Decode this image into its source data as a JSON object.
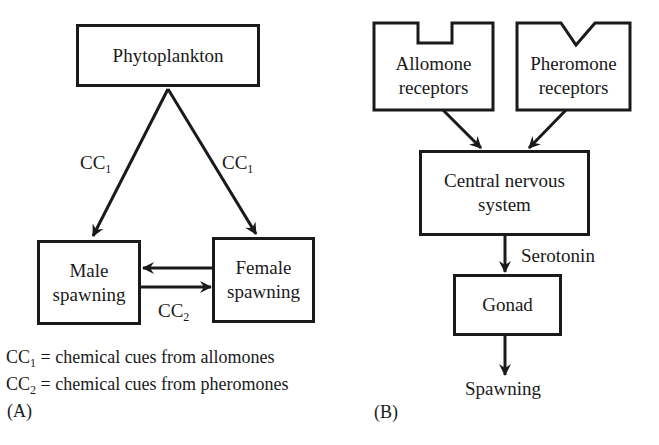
{
  "panel_a": {
    "label": "(A)",
    "nodes": {
      "phytoplankton": "Phytoplankton",
      "male_line1": "Male",
      "male_line2": "spawning",
      "female_line1": "Female",
      "female_line2": "spawning"
    },
    "edges": {
      "left_cue": "CC",
      "left_cue_sub": "1",
      "right_cue": "CC",
      "right_cue_sub": "1",
      "pair_cue": "CC",
      "pair_cue_sub": "2"
    },
    "legend": [
      {
        "symbol": "CC",
        "sub": "1",
        "text": "= chemical cues from allomones"
      },
      {
        "symbol": "CC",
        "sub": "2",
        "text": "= chemical cues from pheromones"
      }
    ]
  },
  "panel_b": {
    "label": "(B)",
    "nodes": {
      "allomone_line1": "Allomone",
      "allomone_line2": "receptors",
      "pheromone_line1": "Pheromone",
      "pheromone_line2": "receptors",
      "cns_line1": "Central nervous",
      "cns_line2": "system",
      "gonad": "Gonad",
      "spawning": "Spawning"
    },
    "edges": {
      "cns_to_gonad": "Serotonin"
    }
  },
  "colors": {
    "stroke": "#1a1a1a",
    "background": "#ffffff"
  }
}
